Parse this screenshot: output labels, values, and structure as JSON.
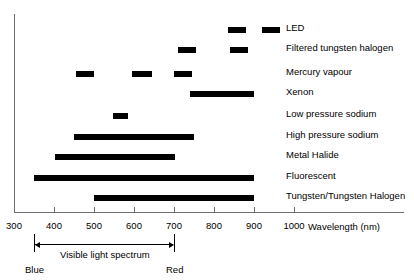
{
  "chart_data": {
    "type": "bar",
    "title": "",
    "xlabel": "Wavelength (nm)",
    "ylabel": "",
    "xlim": [
      300,
      1000
    ],
    "x_ticks": [
      300,
      400,
      500,
      600,
      700,
      800,
      900,
      1000
    ],
    "x_tick_labels": [
      "300",
      "400",
      "500",
      "600",
      "700",
      "800",
      "900",
      "1000"
    ],
    "grid": false,
    "legend": "none",
    "orientation": "horizontal",
    "note": "Horizontal range bars showing emission wavelength coverage of light sources",
    "categories": [
      "LED",
      "Filtered tungsten halogen",
      "Mercury vapour",
      "Xenon",
      "Low pressure sodium",
      "High pressure sodium",
      "Metal Halide",
      "Fluorescent",
      "Tungsten/Tungsten Halogen"
    ],
    "series": [
      {
        "name": "LED",
        "ranges": [
          [
            535,
            580
          ],
          [
            620,
            665
          ]
        ]
      },
      {
        "name": "Filtered tungsten halogen",
        "ranges": [
          [
            710,
            755
          ],
          [
            840,
            885
          ]
        ]
      },
      {
        "name": "Mercury vapour",
        "ranges": [
          [
            455,
            500
          ],
          [
            595,
            645
          ],
          [
            700,
            745
          ]
        ]
      },
      {
        "name": "Xenon",
        "ranges": [
          [
            740,
            900
          ]
        ]
      },
      {
        "name": "Low pressure sodium",
        "ranges": [
          [
            548,
            585
          ]
        ]
      },
      {
        "name": "High pressure sodium",
        "ranges": [
          [
            450,
            750
          ]
        ]
      },
      {
        "name": "Metal Halide",
        "ranges": [
          [
            400,
            700
          ]
        ]
      },
      {
        "name": "Fluorescent",
        "ranges": [
          [
            350,
            900
          ]
        ]
      },
      {
        "name": "Tungsten/Tungsten Halogen",
        "ranges": [
          [
            500,
            900
          ]
        ]
      }
    ],
    "annotation": {
      "label": "Visible light spectrum",
      "start_label": "Blue",
      "end_label": "Red",
      "start": 350,
      "end": 700
    },
    "colors": {
      "bar": "#000000",
      "axis": "#6e6e6e",
      "text": "#000000",
      "background": "#ffffff"
    }
  },
  "rows": [
    {
      "label": "LED",
      "y": 27,
      "label_y": 22,
      "bars": [
        {
          "x": 228,
          "w": 18
        },
        {
          "x": 262,
          "w": 18
        }
      ]
    },
    {
      "label": "Filtered tungsten halogen",
      "y": 47,
      "label_y": 42,
      "bars": [
        {
          "x": 178,
          "w": 18
        },
        {
          "x": 230,
          "w": 18
        }
      ]
    },
    {
      "label": "Mercury vapour",
      "y": 71,
      "label_y": 66,
      "bars": [
        {
          "x": 76,
          "w": 18
        },
        {
          "x": 132,
          "w": 20
        },
        {
          "x": 174,
          "w": 18
        }
      ]
    },
    {
      "label": "Xenon",
      "y": 91,
      "label_y": 86,
      "bars": [
        {
          "x": 190,
          "w": 64
        }
      ]
    },
    {
      "label": "Low pressure sodium",
      "y": 113,
      "label_y": 108,
      "bars": [
        {
          "x": 113,
          "w": 15
        }
      ]
    },
    {
      "label": "High pressure sodium",
      "y": 134,
      "label_y": 129,
      "bars": [
        {
          "x": 74,
          "w": 120
        }
      ]
    },
    {
      "label": "Metal Halide",
      "y": 154,
      "label_y": 149,
      "bars": [
        {
          "x": 55,
          "w": 120
        }
      ]
    },
    {
      "label": "Fluorescent",
      "y": 175,
      "label_y": 170,
      "bars": [
        {
          "x": 34,
          "w": 220
        }
      ]
    },
    {
      "label": "Tungsten/Tungsten Halogen",
      "y": 195,
      "label_y": 190,
      "bars": [
        {
          "x": 94,
          "w": 160
        }
      ]
    }
  ],
  "axis": {
    "x_start_px": 14,
    "px_per_nm": 0.4,
    "title": "Wavelength (nm)",
    "ticks": [
      {
        "label": "300",
        "x": 14
      },
      {
        "label": "400",
        "x": 54
      },
      {
        "label": "500",
        "x": 94
      },
      {
        "label": "600",
        "x": 134
      },
      {
        "label": "700",
        "x": 174
      },
      {
        "label": "800",
        "x": 214
      },
      {
        "label": "900",
        "x": 254
      },
      {
        "label": "1000",
        "x": 294
      }
    ]
  },
  "spectrum": {
    "label": "Visible light spectrum",
    "blue_label": "Blue",
    "red_label": "Red",
    "start_x": 34,
    "end_x": 174
  }
}
